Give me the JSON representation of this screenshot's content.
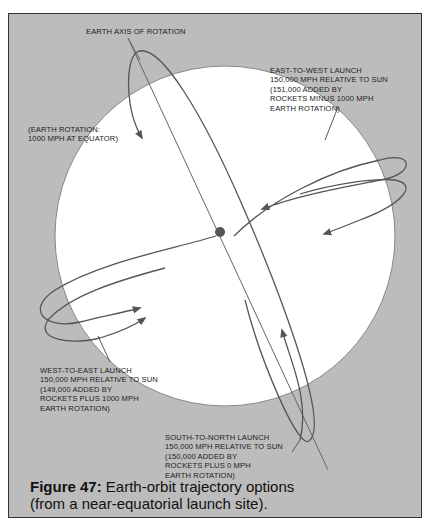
{
  "figure": {
    "number_label": "Figure 47:",
    "caption_line1": "Earth-orbit trajectory options",
    "caption_line2": "(from a near-equatorial launch site)."
  },
  "labels": {
    "axis": "EARTH AXIS OF ROTATION",
    "rotation": "(EARTH ROTATION:\n1000 MPH AT EQUATOR)",
    "east_to_west": "EAST-TO-WEST LAUNCH\n150,000 MPH RELATIVE TO SUN\n(151,000 ADDED BY\nROCKETS MINUS 1000 MPH\nEARTH ROTATION)",
    "west_to_east": "WEST-TO-EAST LAUNCH\n150,000 MPH RELATIVE TO SUN\n(149,000 ADDED BY\nROCKETS PLUS 1000 MPH\nEARTH ROTATION)",
    "south_to_north": "SOUTH-TO-NORTH LAUNCH\n150,000 MPH RELATIVE TO SUN\n(150,000 ADDED BY\nROCKETS PLUS 0 MPH\nEARTH ROTATION)"
  },
  "colors": {
    "background": "#bcbcbc",
    "earth": "#ffffff",
    "line": "#555555",
    "text": "#222222"
  }
}
